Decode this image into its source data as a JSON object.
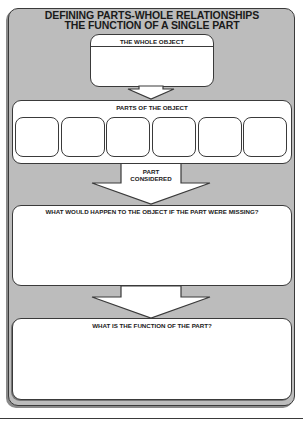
{
  "title": {
    "line1": "DEFINING PARTS-WHOLE RELATIONSHIPS",
    "line2": "THE FUNCTION OF A SINGLE PART"
  },
  "whole_object": {
    "label": "THE WHOLE OBJECT",
    "value": ""
  },
  "parts": {
    "label": "PARTS OF THE OBJECT",
    "slots": [
      "",
      "",
      "",
      "",
      "",
      ""
    ]
  },
  "part_considered": {
    "label_line1": "PART",
    "label_line2": "CONSIDERED"
  },
  "missing": {
    "label": "WHAT WOULD HAPPEN TO THE OBJECT IF THE PART WERE MISSING?",
    "value": ""
  },
  "function": {
    "label": "WHAT IS THE FUNCTION OF THE PART?",
    "value": ""
  },
  "colors": {
    "panel": "#bcbcbc",
    "box": "#ffffff",
    "outline": "#3a3a3a",
    "text": "#1a1a1a"
  }
}
